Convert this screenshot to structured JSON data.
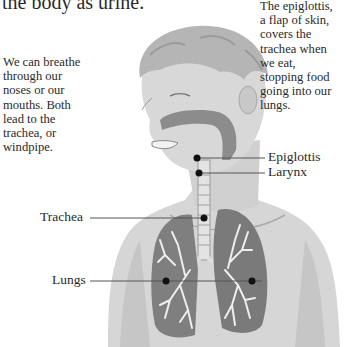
{
  "intro_text_tail": "the body as urine.",
  "annotations": {
    "breathing": "We can breathe\nthrough our\nnoses or our\nmouths. Both\nlead to the\ntrachea, or\nwindpipe.",
    "epiglottis_note": "The epiglottis,\na flap of skin,\ncovers the\ntrachea when\nwe eat,\nstopping food\ngoing into our\nlungs."
  },
  "labels": {
    "epiglottis": "Epiglottis",
    "larynx": "Larynx",
    "trachea": "Trachea",
    "lungs": "Lungs"
  },
  "colors": {
    "text": "#2a2a2a",
    "skin": "#d6d6d6",
    "skin_shadow": "#bdbdbd",
    "hair": "#b5b5b5",
    "airway": "#8c8c8c",
    "lung": "#7a7a7a",
    "bronchi": "#eeeeee",
    "leader_line": "#555555"
  }
}
